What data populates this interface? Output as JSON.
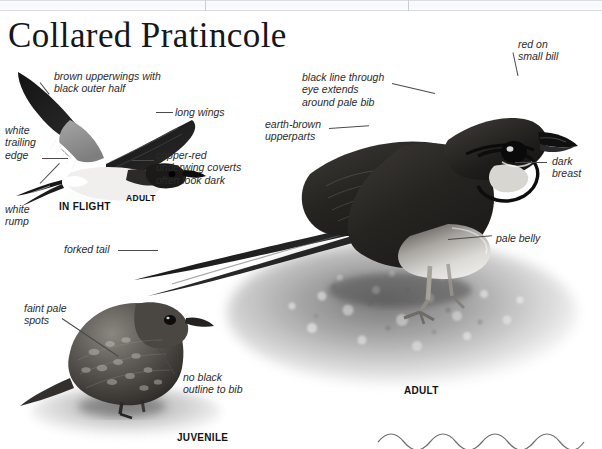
{
  "page": {
    "title": "Collared Pratincole",
    "background_color": "#ffffff",
    "width": 602,
    "height": 449
  },
  "header_strip": {
    "present": true,
    "description": "faint scanned table rules across top of page",
    "rule_color": "#d9dde2"
  },
  "flight_figure": {
    "caption": "IN FLIGHT",
    "adult_tag": "ADULT",
    "labels": [
      {
        "id": "brown-upperwings",
        "text": "brown upperwings with\nblack outer half",
        "x": 54,
        "y": 70
      },
      {
        "id": "long-wings",
        "text": "long wings",
        "x": 173,
        "y": 104
      },
      {
        "id": "white-trailing-edge",
        "text": "white\ntrailing\nedge",
        "x": 5,
        "y": 125
      },
      {
        "id": "copper-red-underwing",
        "text": "copper-red\nunderwing coverts\noften look dark",
        "x": 155,
        "y": 150
      },
      {
        "id": "white-rump",
        "text": "white\nrump",
        "x": 5,
        "y": 205
      },
      {
        "id": "forked-tail",
        "text": "forked tail",
        "x": 64,
        "y": 243
      }
    ]
  },
  "adult_figure": {
    "caption": "ADULT",
    "labels": [
      {
        "id": "red-on-small-bill",
        "text": "red on\nsmall bill",
        "x": 518,
        "y": 38
      },
      {
        "id": "black-line-through-eye",
        "text": "black line through\neye extends\naround pale bib",
        "x": 302,
        "y": 72
      },
      {
        "id": "earth-brown-upperparts",
        "text": "earth-brown\nupperparts",
        "x": 265,
        "y": 118
      },
      {
        "id": "dark-breast",
        "text": "dark\nbreast",
        "x": 552,
        "y": 155
      },
      {
        "id": "pale-belly",
        "text": "pale belly",
        "x": 496,
        "y": 230
      }
    ]
  },
  "juvenile_figure": {
    "caption": "JUVENILE",
    "labels": [
      {
        "id": "faint-pale-spots",
        "text": "faint pale\nspots",
        "x": 24,
        "y": 303
      },
      {
        "id": "no-black-outline-to-bib",
        "text": "no black\noutline to bib",
        "x": 183,
        "y": 373
      }
    ]
  },
  "decoration": {
    "wave_rule": "sinusoidal rule",
    "wave_color": "#6e6e6e"
  },
  "palette": {
    "ink": "#15171a",
    "label_ink": "#2b2b2b",
    "leader": "#4a4a4a",
    "wing_black": "#1b1b1b",
    "wing_grey": "#8f8f8f",
    "belly_white": "#f2f2f2",
    "ground_grey": "#b9b9b9"
  }
}
